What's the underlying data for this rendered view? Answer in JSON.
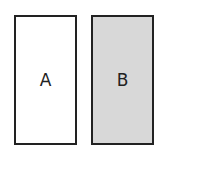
{
  "diagram": {
    "boxes": [
      {
        "label": "A",
        "fill": "#ffffff"
      },
      {
        "label": "B",
        "fill": "#d8d8d8"
      }
    ],
    "border_color": "#222222"
  }
}
